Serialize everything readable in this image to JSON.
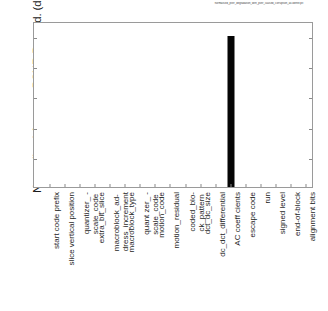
{
  "chart_data": {
    "type": "bar",
    "title": "normalised_psnr_degradation_with_psnr_caused_corruption_all-identif.plt",
    "xlabel": "",
    "ylabel": "Normalised Average PSNR Degrad. (dB)",
    "ylim": [
      0,
      11
    ],
    "yticks": [
      2,
      4,
      6,
      8,
      10
    ],
    "ytick_labels": [
      "2",
      "4",
      "6",
      "8",
      "10"
    ],
    "grid": false,
    "legend": "none",
    "bar_color": "#050505",
    "axis_color": "#9a9a9a",
    "categories": [
      "start code prefix",
      "slice vertical position",
      "quantizer_ -\nscale_code",
      "extra_bit_slice",
      "macroblock_ad-\ndress_increment",
      "macroblock_type",
      "quant zer_ -\nscale_code",
      "motion_code",
      "motion_residual",
      "coded_blo-\nck_pattern",
      "dct_dc_size",
      "dc_dct_differential",
      "AC coeff cients",
      "escape code",
      "run",
      "signed level",
      "end-of-block",
      "alignment bits"
    ],
    "values": [
      0,
      0,
      0,
      0,
      0,
      0,
      0,
      0,
      0,
      0,
      0,
      0,
      10,
      0,
      0,
      0,
      0,
      0
    ]
  }
}
